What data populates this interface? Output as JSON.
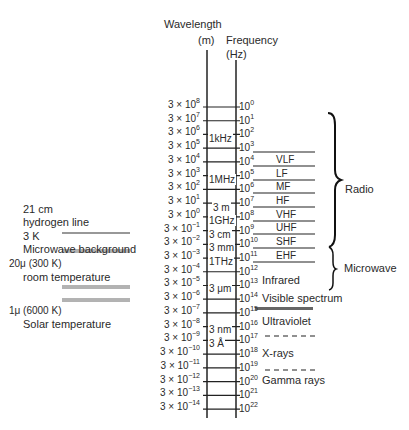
{
  "header": {
    "wavelength_label": "Wavelength",
    "wavelength_unit": "(m)",
    "frequency_label": "Frequency",
    "frequency_unit": "(Hz)"
  },
  "wavelengths": [
    {
      "m": "3 × 10",
      "e": "8"
    },
    {
      "m": "3 × 10",
      "e": "7"
    },
    {
      "m": "3 × 10",
      "e": "6"
    },
    {
      "m": "3 × 10",
      "e": "5"
    },
    {
      "m": "3 × 10",
      "e": "4"
    },
    {
      "m": "3 × 10",
      "e": "3"
    },
    {
      "m": "3 × 10",
      "e": "2"
    },
    {
      "m": "3 × 10",
      "e": "1"
    },
    {
      "m": "3 × 10",
      "e": "0"
    },
    {
      "m": "3 × 10",
      "e": "−1"
    },
    {
      "m": "3 × 10",
      "e": "−2"
    },
    {
      "m": "3 × 10",
      "e": "−3"
    },
    {
      "m": "3 × 10",
      "e": "−4"
    },
    {
      "m": "3 × 10",
      "e": "−5"
    },
    {
      "m": "3 × 10",
      "e": "−6"
    },
    {
      "m": "3 × 10",
      "e": "−7"
    },
    {
      "m": "3 × 10",
      "e": "−8"
    },
    {
      "m": "3 × 10",
      "e": "−9"
    },
    {
      "m": "3 × 10",
      "e": "−10"
    },
    {
      "m": "3 × 10",
      "e": "−11"
    },
    {
      "m": "3 × 10",
      "e": "−12"
    },
    {
      "m": "3 × 10",
      "e": "−13"
    },
    {
      "m": "3 × 10",
      "e": "−14"
    }
  ],
  "frequencies": [
    {
      "m": "10",
      "e": "0"
    },
    {
      "m": "10",
      "e": "1"
    },
    {
      "m": "10",
      "e": "2"
    },
    {
      "m": "10",
      "e": "3"
    },
    {
      "m": "10",
      "e": "4"
    },
    {
      "m": "10",
      "e": "5"
    },
    {
      "m": "10",
      "e": "6"
    },
    {
      "m": "10",
      "e": "7"
    },
    {
      "m": "10",
      "e": "8"
    },
    {
      "m": "10",
      "e": "9"
    },
    {
      "m": "10",
      "e": "10"
    },
    {
      "m": "10",
      "e": "11"
    },
    {
      "m": "10",
      "e": "12"
    },
    {
      "m": "10",
      "e": "13"
    },
    {
      "m": "10",
      "e": "14"
    },
    {
      "m": "10",
      "e": "15"
    },
    {
      "m": "10",
      "e": "16"
    },
    {
      "m": "10",
      "e": "17"
    },
    {
      "m": "10",
      "e": "18"
    },
    {
      "m": "10",
      "e": "19"
    },
    {
      "m": "10",
      "e": "20"
    },
    {
      "m": "10",
      "e": "21"
    },
    {
      "m": "10",
      "e": "22"
    }
  ],
  "inner_labels": {
    "r3": "1kHz",
    "r6": "1MHz",
    "r8": "3 m",
    "r9": "1GHz",
    "r10": "3 cm",
    "r11": "3 mm",
    "r12": "1THz",
    "r14": "3 μm",
    "r17": "3 nm",
    "r18": "3 Å"
  },
  "bands": {
    "vlf": "VLF",
    "lf": "LF",
    "mf": "MF",
    "hf": "HF",
    "vhf": "VHF",
    "uhf": "UHF",
    "shf": "SHF",
    "ehf": "EHF"
  },
  "regions": {
    "infrared": "Infrared",
    "visible": "Visible spectrum",
    "ultraviolet": "Ultraviolet",
    "xrays": "X-rays",
    "gamma": "Gamma rays"
  },
  "groups": {
    "radio": "Radio",
    "microwave": "Microwave"
  },
  "left_notes": {
    "hydrogen_1": "21 cm",
    "hydrogen_2": "hydrogen line",
    "cmb_1": "3 K",
    "cmb_2": "Microwave background",
    "room_1": "20μ (300 K)",
    "room_2": "room temperature",
    "solar_1": "1μ (6000 K)",
    "solar_2": "Solar temperature"
  }
}
